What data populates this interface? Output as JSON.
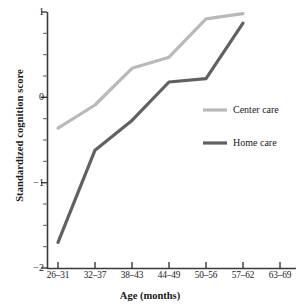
{
  "chart_data": {
    "type": "line",
    "title": "",
    "xlabel": "Age (months)",
    "ylabel": "Standardized cognition score",
    "categories": [
      "26–31",
      "32–37",
      "38–43",
      "44–49",
      "50–56",
      "57–62",
      "63–69"
    ],
    "ylim": [
      -2,
      1
    ],
    "yticks": [
      1,
      0,
      -1,
      -2
    ],
    "ytick_labels": [
      "1",
      "0",
      "−1",
      "−2"
    ],
    "minor_yticks": [
      0.75,
      0.5,
      0.25,
      -0.25,
      -0.5,
      -0.75,
      -1.25,
      -1.5,
      -1.75
    ],
    "grid": false,
    "legend_position": "right-middle",
    "series": [
      {
        "name": "Center care",
        "color": "#b9b9b9",
        "values": [
          -0.36,
          -0.09,
          0.34,
          0.47,
          0.92,
          0.98,
          null
        ]
      },
      {
        "name": "Home care",
        "color": "#616161",
        "values": [
          -1.7,
          -0.62,
          -0.27,
          0.18,
          0.22,
          0.87,
          null
        ]
      }
    ]
  },
  "legend": {
    "items": [
      {
        "label": "Center care",
        "color": "#b9b9b9"
      },
      {
        "label": "Home care",
        "color": "#616161"
      }
    ]
  },
  "axes": {
    "x_title": "Age (months)",
    "y_title": "Standardized cognition score"
  }
}
